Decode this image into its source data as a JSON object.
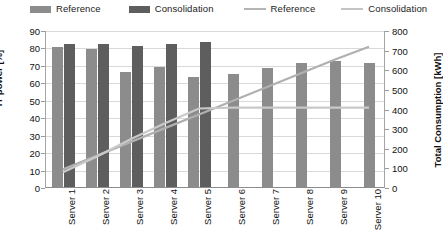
{
  "legend": {
    "items": [
      {
        "label": "Reference",
        "kind": "bar",
        "color": "#8c8c8c"
      },
      {
        "label": "Consolidation",
        "kind": "bar",
        "color": "#5e5e5e"
      },
      {
        "label": "Reference",
        "kind": "line",
        "color": "#b4b4b4"
      },
      {
        "label": "Consolidation",
        "kind": "line",
        "color": "#c4c4c4"
      }
    ]
  },
  "axes": {
    "left": {
      "title": "IT power [%]",
      "min": 0,
      "max": 90,
      "step": 10,
      "ticks": [
        "90",
        "80",
        "70",
        "60",
        "50",
        "40",
        "30",
        "20",
        "10",
        "0"
      ]
    },
    "right": {
      "title": "Total Consumption [kWh]",
      "min": 0,
      "max": 800,
      "step": 100,
      "ticks": [
        "800",
        "700",
        "600",
        "500",
        "400",
        "300",
        "200",
        "100",
        "0"
      ]
    }
  },
  "chart_data": {
    "type": "bar",
    "title": "",
    "xlabel": "",
    "ylabel": "IT power [%]",
    "y2label": "Total Consumption [kWh]",
    "ylim": [
      0,
      90
    ],
    "y2lim": [
      0,
      800
    ],
    "grid": true,
    "legend_position": "top",
    "categories": [
      "Server 1",
      "Server 2",
      "Server 3",
      "Server 4",
      "Server 5",
      "Server 6",
      "Server 7",
      "Server 8",
      "Server 9",
      "Server 10"
    ],
    "series": [
      {
        "name": "Reference",
        "type": "bar",
        "axis": "left",
        "values": [
          80,
          79,
          66,
          69,
          63,
          65,
          68,
          71,
          72,
          71
        ]
      },
      {
        "name": "Consolidation",
        "type": "bar",
        "axis": "left",
        "values": [
          82,
          82,
          81,
          82,
          83,
          null,
          null,
          null,
          null,
          null
        ]
      },
      {
        "name": "Reference",
        "type": "line",
        "axis": "right",
        "values": [
          95,
          165,
          235,
          305,
          375,
          445,
          515,
          585,
          655,
          720
        ]
      },
      {
        "name": "Consolidation",
        "type": "line",
        "axis": "right",
        "values": [
          80,
          160,
          250,
          330,
          405,
          410,
          410,
          410,
          410,
          410
        ]
      }
    ]
  }
}
